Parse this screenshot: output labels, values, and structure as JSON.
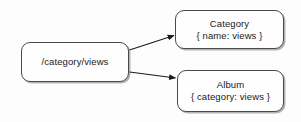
{
  "diagram": {
    "type": "flow-diagram",
    "background_color": "#fdfdfd",
    "node_border_color": "#4a4a4a",
    "node_fill_color": "#fefefe",
    "edge_color": "#1a1a1a",
    "nodes": [
      {
        "id": "source",
        "title": "/category/views",
        "subtitle": "",
        "role": "source-path"
      },
      {
        "id": "category",
        "title": "Category",
        "subtitle": "{ name: views }",
        "role": "target-entity"
      },
      {
        "id": "album",
        "title": "Album",
        "subtitle": "{ category: views }",
        "role": "target-entity"
      }
    ],
    "edges": [
      {
        "from": "source",
        "to": "category",
        "arrowhead": "solid-triangle"
      },
      {
        "from": "source",
        "to": "album",
        "arrowhead": "solid-triangle"
      }
    ]
  }
}
